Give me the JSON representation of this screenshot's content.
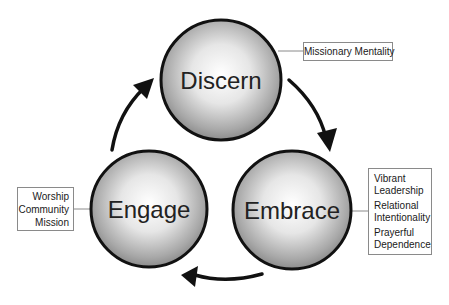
{
  "diagram": {
    "type": "cycle",
    "nodes": [
      {
        "id": "discern",
        "label": "Discern",
        "cx": 221,
        "cy": 80,
        "r": 61
      },
      {
        "id": "embrace",
        "label": "Embrace",
        "cx": 292,
        "cy": 210,
        "r": 60
      },
      {
        "id": "engage",
        "label": "Engage",
        "cx": 149,
        "cy": 209,
        "r": 59
      }
    ],
    "edges": [
      {
        "from": "discern",
        "to": "embrace"
      },
      {
        "from": "embrace",
        "to": "engage"
      },
      {
        "from": "engage",
        "to": "discern"
      }
    ],
    "callouts": {
      "discern": {
        "lines": [
          "Missionary Mentality"
        ]
      },
      "embrace": {
        "lines": [
          "Vibrant Leadership",
          "Relational Intentionality",
          "Prayerful Dependence"
        ]
      },
      "engage": {
        "lines": [
          "Worship",
          "Community",
          "Mission"
        ]
      }
    },
    "colors": {
      "circle_stroke": "#111111",
      "circle_center": "#ffffff",
      "circle_edge": "#8c8c8c",
      "arrow": "#111111",
      "box_border": "#8a8a8a",
      "text": "#222222"
    }
  }
}
